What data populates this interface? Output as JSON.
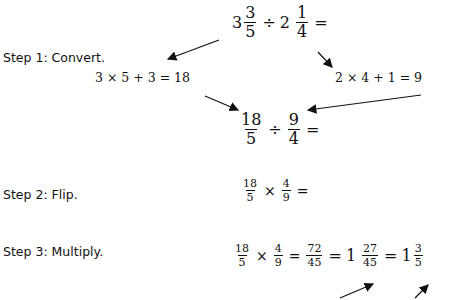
{
  "steps": [
    {
      "label": "Step 1:  Convert."
    },
    {
      "label": "Step 2:  Flip."
    },
    {
      "label": "Step 3:  Multiply."
    }
  ],
  "problem": {
    "a_whole": "3",
    "a_num": "3",
    "a_den": "5",
    "op": "÷",
    "b_whole": "2",
    "b_num": "1",
    "b_den": "4",
    "eq": "="
  },
  "convert": {
    "left_calc": "3  ×  5 + 3 = 18",
    "right_calc": "2  × 4 + 1 = 9"
  },
  "improper": {
    "a_num": "18",
    "a_den": "5",
    "op": "÷",
    "b_num": "9",
    "b_den": "4",
    "eq": "="
  },
  "flip": {
    "a_num": "18",
    "a_den": "5",
    "op": "×",
    "b_num": "4",
    "b_den": "9",
    "eq": "="
  },
  "multiply": {
    "a_num": "18",
    "a_den": "5",
    "op": "×",
    "b_num": "4",
    "b_den": "9",
    "eq1": "=",
    "p_num": "72",
    "p_den": "45",
    "eq2": "=",
    "m_whole": "1",
    "m_num": "27",
    "m_den": "45",
    "eq3": "=",
    "r_whole": "1",
    "r_num": "3",
    "r_den": "5"
  }
}
